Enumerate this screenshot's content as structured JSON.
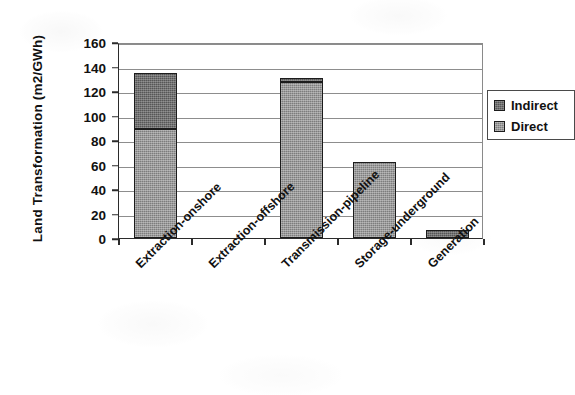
{
  "chart_data": {
    "type": "bar",
    "subtype": "stacked-bar",
    "title": "",
    "xlabel": "",
    "ylabel": "Land Transformation (m2/GWh)",
    "ylim": [
      0,
      160
    ],
    "ytick_interval": 20,
    "yticks": [
      160,
      140,
      120,
      100,
      80,
      60,
      40,
      20,
      0
    ],
    "ytick_labels": [
      "160",
      "140",
      "120",
      "100",
      "80",
      "60",
      "40",
      "20",
      "0"
    ],
    "grid": true,
    "grid_axis": "y",
    "legend_position": "top-right-inside",
    "categories": [
      "Extraction-onshore",
      "Extraction-offshore",
      "Transmission-pipeline",
      "Storage-underground",
      "Generation"
    ],
    "series": [
      {
        "name": "Direct",
        "color": "#7d7d7d",
        "values": [
          89,
          0,
          127,
          62,
          0
        ]
      },
      {
        "name": "Indirect",
        "color": "#565656",
        "values": [
          46,
          0,
          4,
          0,
          6.5
        ]
      }
    ],
    "totals": [
      135,
      0,
      131,
      62,
      6.5
    ],
    "stack_order": [
      "Direct",
      "Indirect"
    ]
  },
  "legend": {
    "items": [
      {
        "label": "Indirect",
        "swatch_color": "#565656"
      },
      {
        "label": "Direct",
        "swatch_color": "#7d7d7d"
      }
    ]
  },
  "axes": {
    "y_title": "Land Transformation (m2/GWh)"
  },
  "colors": {
    "axis": "#2b2b2b",
    "gridline": "#8d8d8d",
    "background": "#ffffff",
    "bar_outline": "#1c1c1c"
  }
}
